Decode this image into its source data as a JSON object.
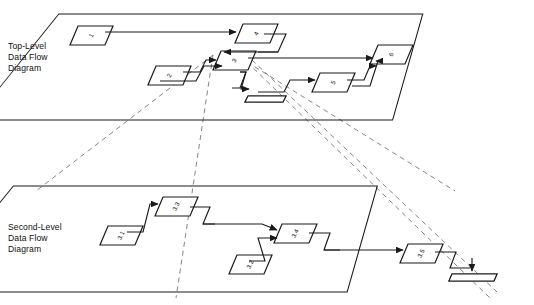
{
  "diagram": {
    "type": "leveled-data-flow-diagram",
    "title_visible": false,
    "style": "isometric stacked planes",
    "colors": {
      "background": "#ffffff",
      "line": "#1a1a1a",
      "projection_line": "#6f6f6f",
      "process_fill": "#ffffff",
      "store_hatch": "#1a1a1a"
    }
  },
  "levels": [
    {
      "id": "top-level",
      "caption": "Top-Level\nData Flow\nDiagram",
      "caption_lines": [
        "Top-Level",
        "Data Flow",
        "Diagram"
      ],
      "processes": [
        {
          "id": "p1",
          "label": "1"
        },
        {
          "id": "p2",
          "label": "2"
        },
        {
          "id": "p3",
          "label": "3"
        },
        {
          "id": "p4",
          "label": "4"
        },
        {
          "id": "p5",
          "label": "5"
        },
        {
          "id": "p6",
          "label": "6"
        }
      ],
      "stores": [
        {
          "id": "d1",
          "label": ""
        }
      ],
      "flows": [
        {
          "from": "1",
          "to": "4"
        },
        {
          "from": "4",
          "to": "3"
        },
        {
          "from": "2",
          "to": "3"
        },
        {
          "from": "2",
          "to": "3"
        },
        {
          "from": "3",
          "to": "6"
        },
        {
          "from": "3",
          "to": "d1"
        },
        {
          "from": "d1",
          "to": "5"
        },
        {
          "from": "5",
          "to": "6"
        }
      ]
    },
    {
      "id": "second-level",
      "caption": "Second-Level\nData Flow\nDiagram",
      "caption_lines": [
        "Second-Level",
        "Data Flow",
        "Diagram"
      ],
      "processes": [
        {
          "id": "p31",
          "label": "3.1"
        },
        {
          "id": "p32",
          "label": "3.2"
        },
        {
          "id": "p33",
          "label": "3.3"
        },
        {
          "id": "p34",
          "label": "3.4"
        },
        {
          "id": "p35",
          "label": "3.5"
        }
      ],
      "stores": [
        {
          "id": "d2",
          "label": ""
        }
      ],
      "flows": [
        {
          "from": "3.1",
          "to": "3.3"
        },
        {
          "from": "3.3",
          "to": "3.4"
        },
        {
          "from": "3.2",
          "to": "3.4"
        },
        {
          "from": "3.4",
          "to": "3.5"
        },
        {
          "from": "3.5",
          "to": "d2"
        }
      ]
    }
  ],
  "explosion": {
    "source_process": "3",
    "target_level": "second-level",
    "line_style": "dashed",
    "description": "Process 3 on the top-level plane explodes into the second-level plane"
  }
}
